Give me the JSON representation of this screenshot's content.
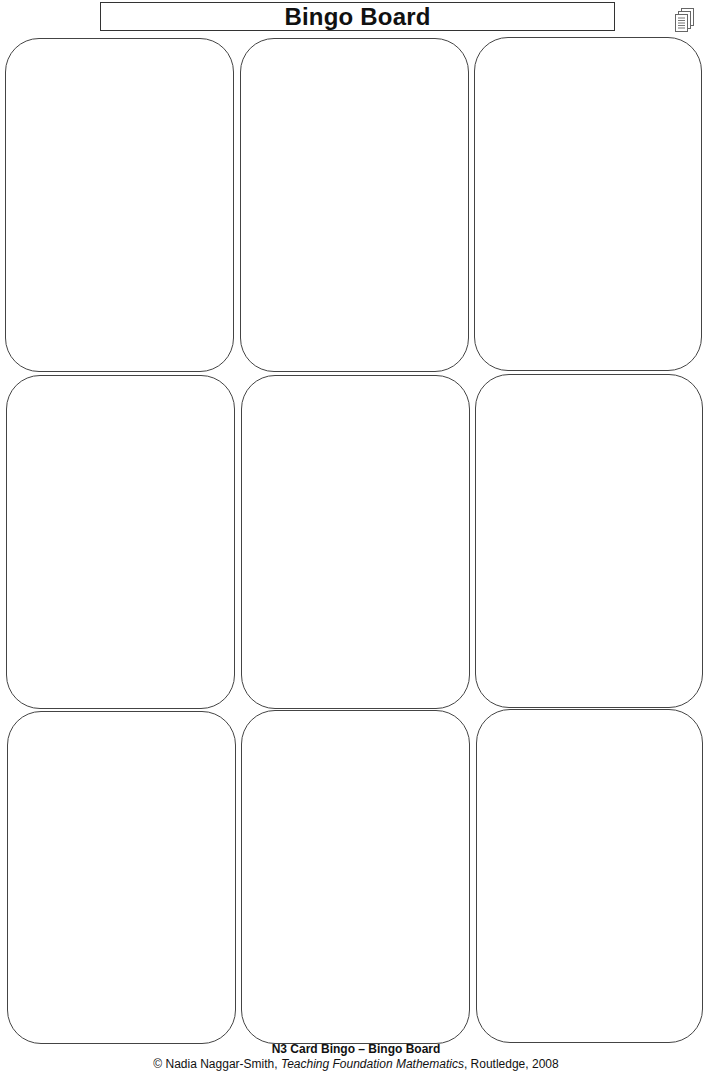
{
  "header": {
    "title": "Bingo Board",
    "icon": "document-stack-icon"
  },
  "board": {
    "rows": 3,
    "columns": 3,
    "cards": [
      {
        "row": 1,
        "col": 1,
        "content": ""
      },
      {
        "row": 1,
        "col": 2,
        "content": ""
      },
      {
        "row": 1,
        "col": 3,
        "content": ""
      },
      {
        "row": 2,
        "col": 1,
        "content": ""
      },
      {
        "row": 2,
        "col": 2,
        "content": ""
      },
      {
        "row": 2,
        "col": 3,
        "content": ""
      },
      {
        "row": 3,
        "col": 1,
        "content": ""
      },
      {
        "row": 3,
        "col": 2,
        "content": ""
      },
      {
        "row": 3,
        "col": 3,
        "content": ""
      }
    ]
  },
  "footer": {
    "title": "N3 Card Bingo – Bingo Board",
    "credit_prefix": "© Nadia Naggar-Smith, ",
    "credit_book": "Teaching Foundation Mathematics",
    "credit_suffix": ", Routledge, 2008"
  }
}
